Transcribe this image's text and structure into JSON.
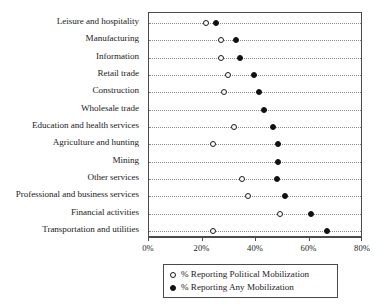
{
  "chart_data": {
    "type": "scatter",
    "title": "",
    "subtitle": "",
    "xlabel": "",
    "ylabel": "",
    "orientation": "horizontal",
    "xlim": [
      0,
      80
    ],
    "xticks": [
      0,
      20,
      40,
      60,
      80
    ],
    "xtick_labels": [
      "0%",
      "20%",
      "40%",
      "60%",
      "80%"
    ],
    "grid": "horizontal-dotted",
    "legend_position": "bottom-center",
    "categories": [
      "Leisure and hospitality",
      "Manufacturing",
      "Information",
      "Retail trade",
      "Construction",
      "Wholesale trade",
      "Education and health services",
      "Agriculture and hunting",
      "Mining",
      "Other services",
      "Professional and business services",
      "Financial activities",
      "Transportation and utilities"
    ],
    "series": [
      {
        "name": "% Reporting Political Mobilization",
        "marker": "open-circle",
        "color": "#111111",
        "values": [
          21.4,
          27.1,
          26.9,
          29.6,
          27.9,
          null,
          31.8,
          24.1,
          null,
          34.6,
          36.9,
          49.1,
          24.1
        ]
      },
      {
        "name": "% Reporting Any Mobilization",
        "marker": "filled-circle",
        "color": "#111111",
        "values": [
          24.9,
          32.4,
          33.9,
          39.4,
          41.3,
          42.9,
          46.3,
          48.1,
          48.3,
          47.9,
          51.0,
          60.6,
          66.6
        ]
      }
    ]
  },
  "legend": {
    "items": [
      {
        "label": "% Reporting Political Mobilization",
        "marker": "open-circle"
      },
      {
        "label": "% Reporting Any Mobilization",
        "marker": "filled-circle"
      }
    ]
  }
}
